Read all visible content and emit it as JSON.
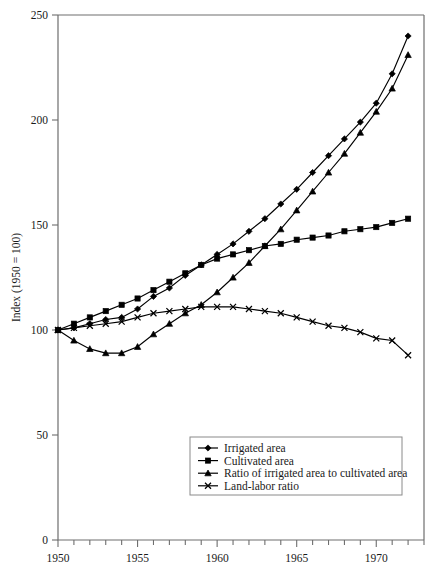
{
  "chart_data": {
    "type": "line",
    "title": "",
    "xlabel": "",
    "ylabel": "Index (1950 = 100)",
    "xlim": [
      1950,
      1973
    ],
    "ylim": [
      0,
      250
    ],
    "yticks": [
      0,
      50,
      100,
      150,
      200,
      250
    ],
    "ytick_labels": [
      "0",
      "50",
      "100",
      "150",
      "200",
      "250"
    ],
    "xticks": [
      1950,
      1955,
      1960,
      1965,
      1970
    ],
    "xtick_labels": [
      "1950",
      "1955",
      "1960",
      "1965",
      "1970"
    ],
    "x_minor_tick_step": 1,
    "grid": false,
    "legend_position": "lower-center",
    "x": [
      1950,
      1951,
      1952,
      1953,
      1954,
      1955,
      1956,
      1957,
      1958,
      1959,
      1960,
      1961,
      1962,
      1963,
      1964,
      1965,
      1966,
      1967,
      1968,
      1969,
      1970,
      1971,
      1972
    ],
    "series": [
      {
        "name": "Irrigated area",
        "marker": "diamond",
        "values": [
          100,
          101,
          103,
          105,
          106,
          110,
          116,
          120,
          126,
          131,
          136,
          141,
          147,
          153,
          160,
          167,
          175,
          183,
          191,
          199,
          208,
          222,
          240
        ]
      },
      {
        "name": "Cultivated area",
        "marker": "square",
        "values": [
          100,
          103,
          106,
          109,
          112,
          115,
          119,
          123,
          127,
          131,
          134,
          136,
          138,
          140,
          141,
          143,
          144,
          145,
          147,
          148,
          149,
          151,
          153
        ]
      },
      {
        "name": "Ratio of irrigated area to cultivated area",
        "marker": "triangle",
        "values": [
          100,
          95,
          91,
          89,
          89,
          92,
          98,
          103,
          108,
          112,
          118,
          125,
          132,
          140,
          148,
          157,
          166,
          175,
          184,
          194,
          204,
          215,
          231
        ]
      },
      {
        "name": "Land-labor ratio",
        "marker": "x",
        "values": [
          100,
          101,
          102,
          103,
          104,
          106,
          108,
          109,
          110,
          111,
          111,
          111,
          110,
          109,
          108,
          106,
          104,
          102,
          101,
          99,
          96,
          95,
          88
        ]
      }
    ]
  },
  "legend": {
    "entries": [
      {
        "label": "Irrigated area",
        "marker": "diamond"
      },
      {
        "label": "Cultivated area",
        "marker": "square"
      },
      {
        "label": "Ratio of irrigated area to cultivated area",
        "marker": "triangle"
      },
      {
        "label": "Land-labor ratio",
        "marker": "x"
      }
    ]
  }
}
